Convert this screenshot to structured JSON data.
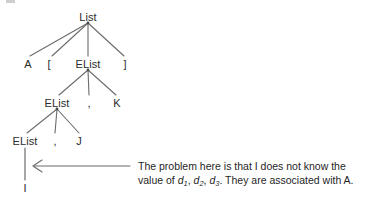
{
  "diagram": {
    "type": "parse-tree",
    "colors": {
      "edge": "#6b6b6b",
      "text": "#2b2b2b",
      "annotation_text": "#1f1f1f",
      "background": "#ffffff",
      "arrow": "#6b6b6b"
    },
    "nodes": [
      {
        "id": "list",
        "label": "List",
        "kind": "nonterminal",
        "x": 88,
        "y": 17
      },
      {
        "id": "a",
        "label": "A",
        "kind": "terminal",
        "x": 28,
        "y": 64
      },
      {
        "id": "lbrack",
        "label": "[",
        "kind": "terminal",
        "x": 49,
        "y": 64
      },
      {
        "id": "elist1",
        "label": "EList",
        "kind": "nonterminal",
        "x": 88,
        "y": 64
      },
      {
        "id": "rbrack",
        "label": "]",
        "kind": "terminal",
        "x": 125,
        "y": 64
      },
      {
        "id": "elist2",
        "label": "EList",
        "kind": "nonterminal",
        "x": 57,
        "y": 103
      },
      {
        "id": "comma1",
        "label": ",",
        "kind": "terminal",
        "x": 89,
        "y": 103
      },
      {
        "id": "k",
        "label": "K",
        "kind": "terminal",
        "x": 117,
        "y": 103
      },
      {
        "id": "elist3",
        "label": "EList",
        "kind": "nonterminal",
        "x": 25,
        "y": 141
      },
      {
        "id": "comma2",
        "label": ",",
        "kind": "terminal",
        "x": 55,
        "y": 141
      },
      {
        "id": "j",
        "label": "J",
        "kind": "terminal",
        "x": 79,
        "y": 141
      },
      {
        "id": "i",
        "label": "I",
        "kind": "terminal",
        "x": 25,
        "y": 188
      }
    ],
    "edges": [
      {
        "from": "list",
        "to": "a"
      },
      {
        "from": "list",
        "to": "lbrack"
      },
      {
        "from": "list",
        "to": "elist1"
      },
      {
        "from": "list",
        "to": "rbrack"
      },
      {
        "from": "elist1",
        "to": "elist2"
      },
      {
        "from": "elist1",
        "to": "comma1"
      },
      {
        "from": "elist1",
        "to": "k"
      },
      {
        "from": "elist2",
        "to": "elist3"
      },
      {
        "from": "elist2",
        "to": "comma2"
      },
      {
        "from": "elist2",
        "to": "j"
      },
      {
        "from": "elist3",
        "to": "i"
      }
    ],
    "annotation": {
      "line1": "The problem here is that I does not know the",
      "line2_prefix": "value of ",
      "var1": "d",
      "var1_sub": "1",
      "sep1": ", ",
      "var2": "d",
      "var2_sub": "2",
      "sep2": ", ",
      "var3": "d",
      "var3_sub": "3",
      "line2_suffix": ". They are associated with A.",
      "arrow_direction": "left",
      "arrow_from_x": 130,
      "arrow_to_x": 33,
      "arrow_y": 166
    }
  }
}
